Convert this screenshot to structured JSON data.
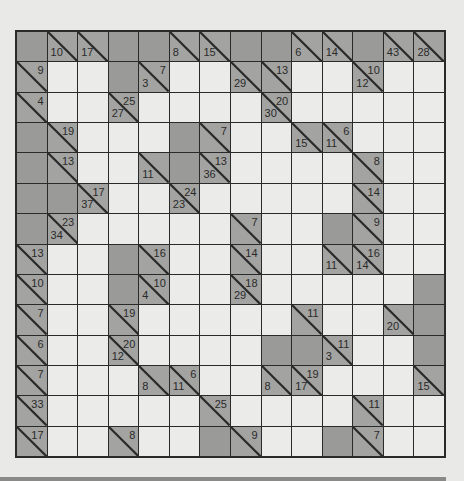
{
  "puzzle": {
    "type": "kakuro",
    "rows": 14,
    "cols": 14,
    "legend": "each clue cell: 'd' = down sum (lower-left), 'r' = across sum (upper-right); 'W' = white entry cell; 'B' = blank shaded cell",
    "grid": [
      [
        {
          "t": "B"
        },
        {
          "t": "C",
          "d": "10"
        },
        {
          "t": "C",
          "d": "17"
        },
        {
          "t": "B"
        },
        {
          "t": "B"
        },
        {
          "t": "C",
          "d": "8"
        },
        {
          "t": "C",
          "d": "15"
        },
        {
          "t": "B"
        },
        {
          "t": "B"
        },
        {
          "t": "C",
          "d": "6"
        },
        {
          "t": "C",
          "d": "14"
        },
        {
          "t": "B"
        },
        {
          "t": "C",
          "d": "43"
        },
        {
          "t": "C",
          "d": "28"
        }
      ],
      [
        {
          "t": "C",
          "r": "9"
        },
        {
          "t": "W"
        },
        {
          "t": "W"
        },
        {
          "t": "B"
        },
        {
          "t": "C",
          "d": "3",
          "r": "7"
        },
        {
          "t": "W"
        },
        {
          "t": "W"
        },
        {
          "t": "C",
          "d": "29"
        },
        {
          "t": "C",
          "r": "13"
        },
        {
          "t": "W"
        },
        {
          "t": "W"
        },
        {
          "t": "C",
          "d": "12",
          "r": "10"
        },
        {
          "t": "W"
        },
        {
          "t": "W"
        }
      ],
      [
        {
          "t": "C",
          "r": "4"
        },
        {
          "t": "W"
        },
        {
          "t": "W"
        },
        {
          "t": "C",
          "d": "27",
          "r": "25"
        },
        {
          "t": "W"
        },
        {
          "t": "W"
        },
        {
          "t": "W"
        },
        {
          "t": "W"
        },
        {
          "t": "C",
          "d": "30",
          "r": "20"
        },
        {
          "t": "W"
        },
        {
          "t": "W"
        },
        {
          "t": "W"
        },
        {
          "t": "W"
        },
        {
          "t": "W"
        }
      ],
      [
        {
          "t": "B"
        },
        {
          "t": "C",
          "r": "19"
        },
        {
          "t": "W"
        },
        {
          "t": "W"
        },
        {
          "t": "W"
        },
        {
          "t": "B"
        },
        {
          "t": "C",
          "r": "7"
        },
        {
          "t": "W"
        },
        {
          "t": "W"
        },
        {
          "t": "C",
          "d": "15"
        },
        {
          "t": "C",
          "d": "11",
          "r": "6"
        },
        {
          "t": "W"
        },
        {
          "t": "W"
        },
        {
          "t": "W"
        }
      ],
      [
        {
          "t": "B"
        },
        {
          "t": "C",
          "r": "13"
        },
        {
          "t": "W"
        },
        {
          "t": "W"
        },
        {
          "t": "C",
          "d": "11"
        },
        {
          "t": "B"
        },
        {
          "t": "C",
          "d": "36",
          "r": "13"
        },
        {
          "t": "W"
        },
        {
          "t": "W"
        },
        {
          "t": "W"
        },
        {
          "t": "W"
        },
        {
          "t": "C",
          "r": "8"
        },
        {
          "t": "W"
        },
        {
          "t": "W"
        }
      ],
      [
        {
          "t": "B"
        },
        {
          "t": "B"
        },
        {
          "t": "C",
          "d": "37",
          "r": "17"
        },
        {
          "t": "W"
        },
        {
          "t": "W"
        },
        {
          "t": "C",
          "d": "23",
          "r": "24"
        },
        {
          "t": "W"
        },
        {
          "t": "W"
        },
        {
          "t": "W"
        },
        {
          "t": "W"
        },
        {
          "t": "W"
        },
        {
          "t": "C",
          "r": "14"
        },
        {
          "t": "W"
        },
        {
          "t": "W"
        }
      ],
      [
        {
          "t": "B"
        },
        {
          "t": "C",
          "d": "34",
          "r": "23"
        },
        {
          "t": "W"
        },
        {
          "t": "W"
        },
        {
          "t": "W"
        },
        {
          "t": "W"
        },
        {
          "t": "W"
        },
        {
          "t": "C",
          "r": "7"
        },
        {
          "t": "W"
        },
        {
          "t": "W"
        },
        {
          "t": "B"
        },
        {
          "t": "C",
          "r": "9"
        },
        {
          "t": "W"
        },
        {
          "t": "W"
        }
      ],
      [
        {
          "t": "C",
          "r": "13"
        },
        {
          "t": "W"
        },
        {
          "t": "W"
        },
        {
          "t": "B"
        },
        {
          "t": "C",
          "r": "16"
        },
        {
          "t": "W"
        },
        {
          "t": "W"
        },
        {
          "t": "C",
          "r": "14"
        },
        {
          "t": "W"
        },
        {
          "t": "W"
        },
        {
          "t": "C",
          "d": "11"
        },
        {
          "t": "C",
          "d": "14",
          "r": "16"
        },
        {
          "t": "W"
        },
        {
          "t": "W"
        }
      ],
      [
        {
          "t": "C",
          "r": "10"
        },
        {
          "t": "W"
        },
        {
          "t": "W"
        },
        {
          "t": "B"
        },
        {
          "t": "C",
          "d": "4",
          "r": "10"
        },
        {
          "t": "W"
        },
        {
          "t": "W"
        },
        {
          "t": "C",
          "d": "29",
          "r": "18"
        },
        {
          "t": "W"
        },
        {
          "t": "W"
        },
        {
          "t": "W"
        },
        {
          "t": "W"
        },
        {
          "t": "W"
        },
        {
          "t": "B"
        }
      ],
      [
        {
          "t": "C",
          "r": "7"
        },
        {
          "t": "W"
        },
        {
          "t": "W"
        },
        {
          "t": "C",
          "r": "19"
        },
        {
          "t": "W"
        },
        {
          "t": "W"
        },
        {
          "t": "W"
        },
        {
          "t": "W"
        },
        {
          "t": "W"
        },
        {
          "t": "C",
          "r": "11"
        },
        {
          "t": "W"
        },
        {
          "t": "W"
        },
        {
          "t": "C",
          "d": "20"
        },
        {
          "t": "B"
        }
      ],
      [
        {
          "t": "C",
          "r": "6"
        },
        {
          "t": "W"
        },
        {
          "t": "W"
        },
        {
          "t": "C",
          "d": "12",
          "r": "20"
        },
        {
          "t": "W"
        },
        {
          "t": "W"
        },
        {
          "t": "W"
        },
        {
          "t": "W"
        },
        {
          "t": "B"
        },
        {
          "t": "B"
        },
        {
          "t": "C",
          "d": "3",
          "r": "11"
        },
        {
          "t": "W"
        },
        {
          "t": "W"
        },
        {
          "t": "B"
        }
      ],
      [
        {
          "t": "C",
          "r": "7"
        },
        {
          "t": "W"
        },
        {
          "t": "W"
        },
        {
          "t": "W"
        },
        {
          "t": "C",
          "d": "8"
        },
        {
          "t": "C",
          "d": "11",
          "r": "6"
        },
        {
          "t": "W"
        },
        {
          "t": "W"
        },
        {
          "t": "C",
          "d": "8"
        },
        {
          "t": "C",
          "d": "17",
          "r": "19"
        },
        {
          "t": "W"
        },
        {
          "t": "W"
        },
        {
          "t": "W"
        },
        {
          "t": "C",
          "d": "15"
        }
      ],
      [
        {
          "t": "C",
          "r": "33"
        },
        {
          "t": "W"
        },
        {
          "t": "W"
        },
        {
          "t": "W"
        },
        {
          "t": "W"
        },
        {
          "t": "W"
        },
        {
          "t": "C",
          "r": "25"
        },
        {
          "t": "W"
        },
        {
          "t": "W"
        },
        {
          "t": "W"
        },
        {
          "t": "W"
        },
        {
          "t": "C",
          "r": "11"
        },
        {
          "t": "W"
        },
        {
          "t": "W"
        }
      ],
      [
        {
          "t": "C",
          "r": "17"
        },
        {
          "t": "W"
        },
        {
          "t": "W"
        },
        {
          "t": "C",
          "r": "8"
        },
        {
          "t": "W"
        },
        {
          "t": "W"
        },
        {
          "t": "B"
        },
        {
          "t": "C",
          "r": "9"
        },
        {
          "t": "W"
        },
        {
          "t": "W"
        },
        {
          "t": "B"
        },
        {
          "t": "C",
          "r": "7"
        },
        {
          "t": "W"
        },
        {
          "t": "W"
        }
      ]
    ]
  },
  "colors": {
    "page_bg": "#e9e9e7",
    "white_cell": "#ebebe9",
    "shaded_cell": "#9a9a98",
    "clue_cell": "#a3a3a1",
    "grid_line": "#2a2a2a"
  }
}
